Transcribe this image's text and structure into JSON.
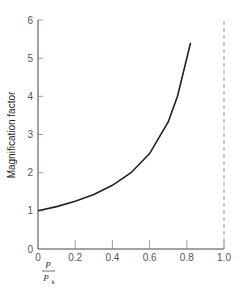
{
  "chart_data": {
    "type": "line",
    "title": "",
    "xlabel": "P / P_k",
    "xlabel_numerator": "P",
    "xlabel_denominator": "P",
    "xlabel_denominator_sub": "k",
    "ylabel": "Magnification factor",
    "xlim": [
      0,
      1.0
    ],
    "ylim": [
      0,
      6
    ],
    "x_ticks": [
      "0",
      "0.2",
      "0.4",
      "0.6",
      "0.8",
      "1.0"
    ],
    "y_ticks": [
      "0",
      "1",
      "2",
      "3",
      "4",
      "5",
      "6"
    ],
    "grid": false,
    "legend": null,
    "series": [
      {
        "name": "Magnification factor",
        "style": "solid",
        "x": [
          0,
          0.1,
          0.2,
          0.3,
          0.4,
          0.5,
          0.6,
          0.7,
          0.75,
          0.8,
          0.82
        ],
        "y": [
          1.0,
          1.11,
          1.25,
          1.43,
          1.67,
          2.0,
          2.5,
          3.33,
          4.0,
          5.0,
          5.4
        ]
      }
    ],
    "annotations": [
      {
        "type": "vertical-dashed-line",
        "x": 1.0,
        "label": "asymptote"
      }
    ]
  }
}
